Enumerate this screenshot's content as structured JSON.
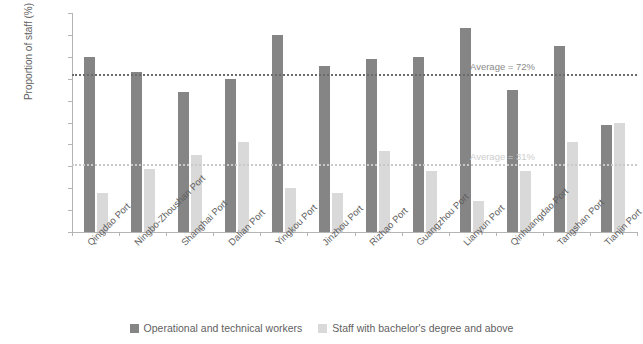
{
  "chart_data": {
    "type": "bar",
    "title": "",
    "xlabel": "",
    "ylabel": "Proportion of staff (%)",
    "ylim": [
      0,
      100
    ],
    "yticks": [
      0,
      10,
      20,
      30,
      40,
      50,
      60,
      70,
      80,
      90,
      100
    ],
    "grid": false,
    "legend_position": "bottom",
    "categories": [
      "Qingdao Port",
      "Ningbo-Zhoushan Port",
      "Shanghai Port",
      "Dalian Port",
      "Yingkou Port",
      "Jinzhou Port",
      "Rizhao Port",
      "Guangzhou Port",
      "Lianyun Port",
      "Qinhuangdao Port",
      "Tangshan Port",
      "Tianjin Port"
    ],
    "series": [
      {
        "name": "Operational and technical workers",
        "color": "#858585",
        "values": [
          80,
          73,
          64,
          70,
          90,
          76,
          79,
          80,
          93,
          65,
          85,
          49
        ]
      },
      {
        "name": "Staff with bachelor's degree and above",
        "color": "#d9d9d9",
        "values": [
          18,
          29,
          35,
          41,
          20,
          18,
          37,
          28,
          14,
          28,
          41,
          50
        ]
      }
    ],
    "annotations": [
      {
        "label": "Average = 72%",
        "value": 72,
        "series": "Operational and technical workers",
        "style": "dark"
      },
      {
        "label": "Average = 31%",
        "value": 31,
        "series": "Staff with bachelor's degree and above",
        "style": "light"
      }
    ]
  }
}
